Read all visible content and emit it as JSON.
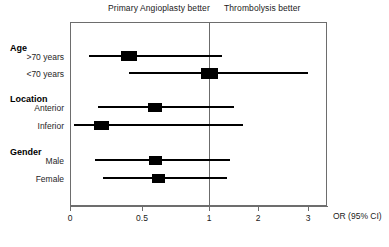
{
  "figure": {
    "type": "forest-plot",
    "left_header": "Primary Angioplasty better",
    "right_header": "Thrombolysis better",
    "axis_title": "OR (95% CI)"
  },
  "axis": {
    "tick_labels": [
      "0",
      "0.5",
      "1",
      "2",
      "3"
    ],
    "tick_values": [
      0,
      0.5,
      1,
      2,
      3
    ],
    "tick_px": [
      70,
      142,
      209,
      258,
      308
    ],
    "reference_value": "1"
  },
  "groups": [
    {
      "label": "Age",
      "rows": [
        {
          "label": ">70 years"
        },
        {
          "label": "<70 years"
        }
      ]
    },
    {
      "label": "Location",
      "rows": [
        {
          "label": "Anterior"
        },
        {
          "label": "Inferior"
        }
      ]
    },
    {
      "label": "Gender",
      "rows": [
        {
          "label": "Male"
        },
        {
          "label": "Female"
        }
      ]
    }
  ],
  "chart_data": {
    "type": "forest",
    "title": "",
    "xlabel": "OR (95% CI)",
    "ylabel": "",
    "xscale": "piecewise-linear",
    "xlim": [
      0,
      3
    ],
    "xticks": [
      0,
      0.5,
      1,
      2,
      3
    ],
    "xticklabels": [
      "0",
      "0.5",
      "1",
      "2",
      "3"
    ],
    "reference_line": 1,
    "grid": false,
    "legend": "none",
    "annotations": [
      {
        "text": "Primary Angioplasty better",
        "side": "left"
      },
      {
        "text": "Thrombolysis better",
        "side": "right"
      }
    ],
    "categories": [
      ">70 years",
      "<70 years",
      "Anterior",
      "Inferior",
      "Male",
      "Female"
    ],
    "groups": [
      "Age",
      "Age",
      "Location",
      "Location",
      "Gender",
      "Gender"
    ],
    "estimates": [
      0.4,
      1.0,
      0.6,
      0.22,
      0.6,
      0.63
    ],
    "ci_low": [
      0.13,
      0.41,
      0.2,
      0.03,
      0.17,
      0.23
    ],
    "ci_high": [
      1.13,
      3.0,
      1.35,
      1.7,
      1.3,
      1.25
    ],
    "marker_sizes": [
      16,
      17,
      14,
      15,
      13,
      13
    ],
    "px": {
      "rows": [
        {
          "label": ">70 years",
          "y": 56,
          "line_x0": 89,
          "line_x1": 222,
          "box_cx": 129,
          "box_w": 16,
          "box_h": 10
        },
        {
          "label": "<70 years",
          "y": 73,
          "line_x0": 129,
          "line_x1": 308,
          "box_cx": 209,
          "box_w": 17,
          "box_h": 11
        },
        {
          "label": "Anterior",
          "y": 107,
          "line_x0": 98,
          "line_x1": 234,
          "box_cx": 155,
          "box_w": 14,
          "box_h": 9
        },
        {
          "label": "Inferior",
          "y": 125,
          "line_x0": 74,
          "line_x1": 243,
          "box_cx": 101,
          "box_w": 15,
          "box_h": 9
        },
        {
          "label": "Male",
          "y": 160,
          "line_x0": 95,
          "line_x1": 230,
          "box_cx": 155,
          "box_w": 13,
          "box_h": 9
        },
        {
          "label": "Female",
          "y": 178,
          "line_x0": 103,
          "line_x1": 227,
          "box_cx": 158,
          "box_w": 13,
          "box_h": 9
        }
      ]
    }
  },
  "style": {
    "marker_color": "#000000",
    "line_color": "#000000",
    "frame_color": "#6d6d6d",
    "background": "#ffffff"
  },
  "layout": {
    "group_label_y": [
      43,
      94,
      147
    ],
    "row_label_y": [
      52,
      69,
      103,
      121,
      156,
      174
    ],
    "top_header_left_x": 108,
    "top_header_left_y": 3,
    "top_header_right_x": 224,
    "top_header_right_y": 3
  }
}
